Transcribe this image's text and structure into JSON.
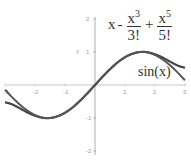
{
  "chart_data": {
    "type": "line",
    "title": "",
    "xlabel": "",
    "ylabel": "y",
    "xlim": [
      -3,
      3
    ],
    "ylim": [
      -2,
      2
    ],
    "x_ticks": [
      "-3",
      "-2",
      "-1",
      "1",
      "2",
      "3"
    ],
    "y_ticks": [
      "2",
      "1",
      "-1",
      "-2"
    ],
    "grid": false,
    "series": [
      {
        "name": "sin(x)",
        "function": "sin(x)",
        "color": "#555555"
      },
      {
        "name": "x - x^3/3! + x^5/5!",
        "function": "x - x^3/6 + x^5/120",
        "color": "#444444"
      }
    ],
    "annotations": [
      {
        "text": "x - x^3/3! + x^5/5!",
        "position": "top-right"
      },
      {
        "text": "sin(x)",
        "position": "right, below curve peak"
      }
    ]
  },
  "labels": {
    "y_axis": "y",
    "formula": {
      "x": "x",
      "minus": "-",
      "plus": "+",
      "num1": "x",
      "exp1": "3",
      "den1": "3!",
      "num2": "x",
      "exp2": "5",
      "den2": "5!"
    },
    "sin": "sin(x)",
    "ticks_x": {
      "m3": "-3",
      "m2": "-2",
      "m1": "-1",
      "p1": "1",
      "p2": "2",
      "p3": "3"
    },
    "ticks_y": {
      "p2": "2",
      "p1": "1",
      "m1": "-1",
      "m2": "-2"
    }
  }
}
